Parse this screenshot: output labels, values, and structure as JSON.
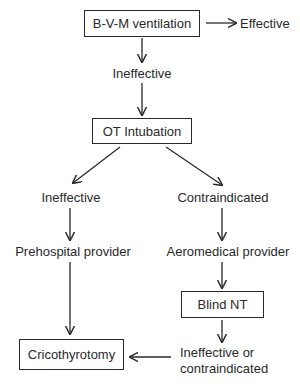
{
  "diagram": {
    "nodes": {
      "bvm": {
        "label": "B-V-M ventilation",
        "type": "box"
      },
      "effective": {
        "label": "Effective",
        "type": "text"
      },
      "ineffective_1": {
        "label": "Ineffective",
        "type": "text"
      },
      "ot": {
        "label": "OT Intubation",
        "type": "box"
      },
      "ineffective_2": {
        "label": "Ineffective",
        "type": "text"
      },
      "contraindicated": {
        "label": "Contraindicated",
        "type": "text"
      },
      "prehospital": {
        "label": "Prehospital provider",
        "type": "text"
      },
      "aeromedical": {
        "label": "Aeromedical provider",
        "type": "text"
      },
      "blind_nt": {
        "label": "Blind NT",
        "type": "box"
      },
      "ineffective_or_1": {
        "label": "Ineffective or",
        "type": "text"
      },
      "ineffective_or_2": {
        "label": "contraindicated",
        "type": "text"
      },
      "crico": {
        "label": "Cricothyrotomy",
        "type": "box"
      }
    },
    "edges": [
      [
        "bvm",
        "effective"
      ],
      [
        "bvm",
        "ineffective_1"
      ],
      [
        "ineffective_1",
        "ot"
      ],
      [
        "ot",
        "ineffective_2"
      ],
      [
        "ot",
        "contraindicated"
      ],
      [
        "ineffective_2",
        "prehospital"
      ],
      [
        "contraindicated",
        "aeromedical"
      ],
      [
        "prehospital",
        "crico"
      ],
      [
        "aeromedical",
        "blind_nt"
      ],
      [
        "blind_nt",
        "ineffective_or"
      ],
      [
        "ineffective_or",
        "crico"
      ]
    ],
    "colors": {
      "line": "#2a2a2a",
      "background": "#ffffff"
    }
  }
}
